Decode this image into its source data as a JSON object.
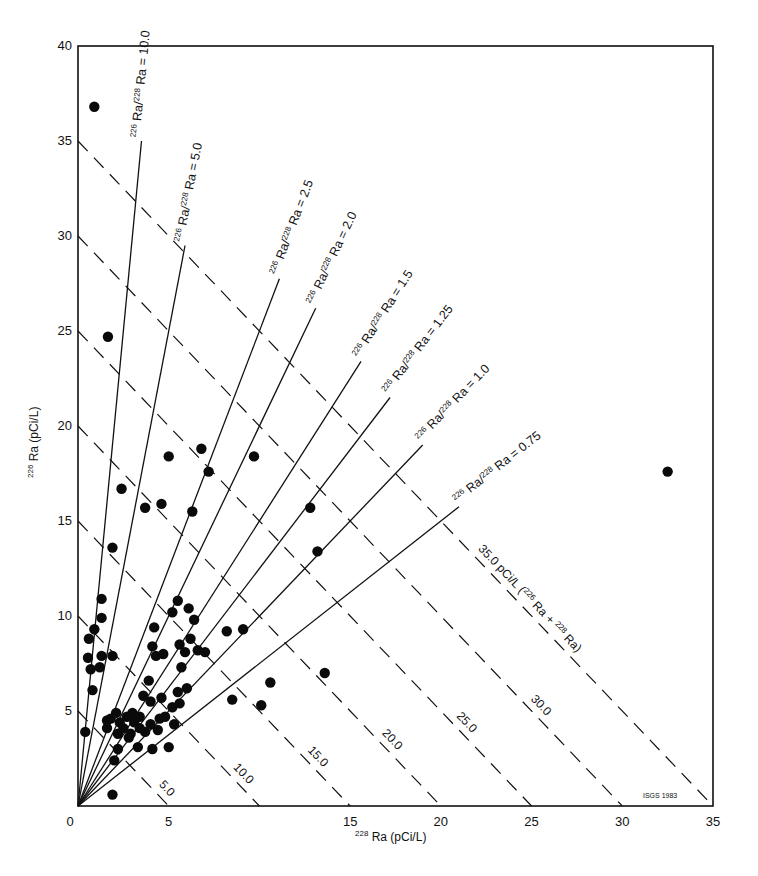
{
  "chart_data": {
    "type": "scatter",
    "title": "",
    "xlabel": "228 Ra (pCi/L)",
    "ylabel": "226 Ra (pCi/L)",
    "xlim": [
      0,
      35
    ],
    "ylim": [
      0,
      40
    ],
    "x_ticks": [
      "0",
      "5",
      "15",
      "20",
      "25",
      "30",
      "35"
    ],
    "x_tick_values": [
      0,
      5,
      15,
      20,
      25,
      30,
      35
    ],
    "y_ticks": [
      "5",
      "10",
      "15",
      "20",
      "25",
      "30",
      "35",
      "40"
    ],
    "y_tick_values": [
      5,
      10,
      15,
      20,
      25,
      30,
      35,
      40
    ],
    "grid": false,
    "credit": "ISGS 1983",
    "ratio_lines": [
      {
        "ratio": 10.0,
        "label": "226 Ra/228 Ra = 10.0",
        "x_end": 3.5
      },
      {
        "ratio": 5.0,
        "label": "226 Ra/228 Ra = 5.0",
        "x_end": 5.9
      },
      {
        "ratio": 2.5,
        "label": "226 Ra/228 Ra = 2.5",
        "x_end": 11.1
      },
      {
        "ratio": 2.0,
        "label": "226 Ra/228 Ra = 2.0",
        "x_end": 13.1
      },
      {
        "ratio": 1.5,
        "label": "226 Ra/228 Ra = 1.5",
        "x_end": 15.6
      },
      {
        "ratio": 1.25,
        "label": "226 Ra/228 Ra = 1.25",
        "x_end": 17.2
      },
      {
        "ratio": 1.0,
        "label": "226 Ra/228 Ra = 1.0",
        "x_end": 19.0
      },
      {
        "ratio": 0.75,
        "label": "226 Ra/228 Ra = 0.75",
        "x_end": 21.0
      }
    ],
    "sum_lines": [
      {
        "sum": 5.0,
        "label": "5.0"
      },
      {
        "sum": 10.0,
        "label": "10.0"
      },
      {
        "sum": 15.0,
        "label": "15.0"
      },
      {
        "sum": 20.0,
        "label": "20.0"
      },
      {
        "sum": 25.0,
        "label": "25.0"
      },
      {
        "sum": 30.0,
        "label": "30.0"
      },
      {
        "sum": 35.0,
        "label": "35.0 pCi/L (226 Ra + 228 Ra)"
      }
    ],
    "series": [
      {
        "name": "samples",
        "points": [
          [
            0.9,
            36.8
          ],
          [
            1.65,
            24.7
          ],
          [
            2.4,
            16.7
          ],
          [
            1.9,
            13.6
          ],
          [
            3.7,
            15.7
          ],
          [
            4.6,
            15.9
          ],
          [
            5.0,
            18.4
          ],
          [
            6.8,
            18.8
          ],
          [
            7.2,
            17.6
          ],
          [
            6.3,
            15.5
          ],
          [
            9.7,
            18.4
          ],
          [
            12.8,
            15.7
          ],
          [
            13.2,
            13.4
          ],
          [
            32.5,
            17.6
          ],
          [
            1.3,
            10.9
          ],
          [
            1.3,
            9.9
          ],
          [
            0.9,
            9.3
          ],
          [
            0.6,
            8.8
          ],
          [
            0.55,
            7.8
          ],
          [
            1.3,
            7.9
          ],
          [
            1.9,
            7.9
          ],
          [
            0.7,
            7.2
          ],
          [
            1.2,
            7.3
          ],
          [
            0.8,
            6.1
          ],
          [
            0.4,
            3.9
          ],
          [
            1.9,
            0.6
          ],
          [
            5.5,
            10.8
          ],
          [
            5.2,
            10.2
          ],
          [
            6.1,
            10.4
          ],
          [
            6.4,
            9.8
          ],
          [
            4.2,
            9.4
          ],
          [
            6.2,
            8.8
          ],
          [
            4.1,
            8.4
          ],
          [
            5.6,
            8.5
          ],
          [
            6.6,
            8.2
          ],
          [
            7.0,
            8.1
          ],
          [
            4.7,
            8.0
          ],
          [
            4.3,
            7.9
          ],
          [
            5.7,
            7.3
          ],
          [
            5.9,
            8.1
          ],
          [
            8.2,
            9.2
          ],
          [
            9.1,
            9.3
          ],
          [
            8.5,
            5.6
          ],
          [
            10.1,
            5.3
          ],
          [
            10.6,
            6.5
          ],
          [
            13.6,
            7.0
          ],
          [
            3.9,
            6.6
          ],
          [
            4.6,
            5.7
          ],
          [
            4.0,
            5.5
          ],
          [
            5.2,
            5.2
          ],
          [
            5.5,
            6.0
          ],
          [
            6.0,
            6.2
          ],
          [
            4.8,
            4.7
          ],
          [
            5.3,
            4.3
          ],
          [
            4.4,
            4.0
          ],
          [
            5.6,
            5.4
          ],
          [
            3.6,
            5.8
          ],
          [
            5.0,
            3.1
          ],
          [
            4.1,
            3.0
          ],
          [
            3.0,
            4.9
          ],
          [
            2.7,
            4.7
          ],
          [
            3.4,
            4.7
          ],
          [
            2.1,
            4.9
          ],
          [
            2.5,
            4.1
          ],
          [
            3.1,
            4.4
          ],
          [
            2.3,
            4.4
          ],
          [
            1.8,
            4.6
          ],
          [
            1.6,
            4.1
          ],
          [
            2.8,
            3.6
          ],
          [
            3.3,
            3.1
          ],
          [
            2.2,
            3.0
          ],
          [
            2.9,
            3.8
          ],
          [
            2.0,
            2.4
          ],
          [
            3.7,
            3.9
          ],
          [
            3.4,
            4.1
          ],
          [
            1.6,
            4.5
          ],
          [
            2.2,
            3.8
          ],
          [
            4.5,
            4.6
          ],
          [
            4.0,
            4.3
          ]
        ]
      }
    ]
  }
}
